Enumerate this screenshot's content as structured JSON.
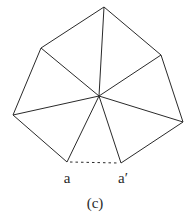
{
  "diagram": {
    "caption": "(c)",
    "labels": {
      "a": "a",
      "a_prime": "a′"
    },
    "center": [
      99,
      96
    ],
    "vertices": [
      {
        "id": "a",
        "pt": [
          67,
          162
        ]
      },
      {
        "id": "left",
        "pt": [
          13,
          115
        ]
      },
      {
        "id": "upper-left",
        "pt": [
          41,
          48
        ]
      },
      {
        "id": "top",
        "pt": [
          104,
          7
        ]
      },
      {
        "id": "upper-right",
        "pt": [
          161,
          55
        ]
      },
      {
        "id": "right",
        "pt": [
          183,
          122
        ]
      },
      {
        "id": "a_prime",
        "pt": [
          121,
          163
        ]
      }
    ],
    "gap_edge": {
      "from": "a",
      "to": "a_prime",
      "style": "dashed"
    },
    "colors": {
      "stroke": "#2a2a2a",
      "background": "#ffffff"
    }
  }
}
